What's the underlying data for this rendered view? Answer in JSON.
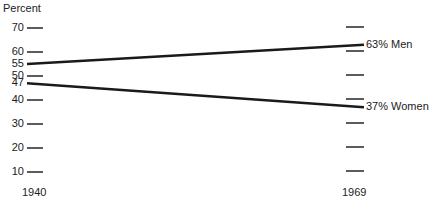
{
  "chart_data": {
    "type": "line",
    "title": "",
    "ylabel": "Percent",
    "xlabel": "",
    "categories": [
      "1940",
      "1969"
    ],
    "x": [
      1940,
      1969
    ],
    "series": [
      {
        "name": "Men",
        "values": [
          55,
          63
        ],
        "end_label": "63% Men"
      },
      {
        "name": "Women",
        "values": [
          47,
          37
        ],
        "end_label": "37% Women"
      }
    ],
    "left_axis_ticks": [
      70,
      60,
      55,
      50,
      47,
      40,
      30,
      20,
      10
    ],
    "right_axis_ticks": [
      70,
      60,
      50,
      40,
      30,
      20,
      10
    ],
    "ylim": [
      10,
      70
    ],
    "grid": false,
    "legend": "direct labels at line ends"
  },
  "labels": {
    "ylabel": "Percent",
    "x_start": "1940",
    "x_end": "1969",
    "men_end": "63% Men",
    "women_end": "37% Women"
  },
  "colors": {
    "line": "#1a1a1a",
    "tick": "#333333",
    "text": "#222222"
  }
}
